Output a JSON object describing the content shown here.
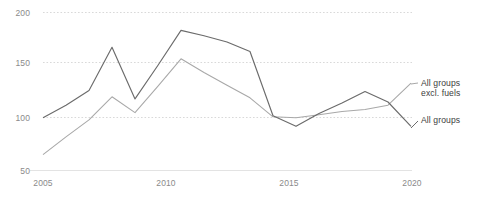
{
  "chart_data": {
    "type": "line",
    "title": "",
    "subtitle": "",
    "xlabel": "",
    "ylabel": "",
    "xlim": [
      2005,
      2021
    ],
    "ylim": [
      50,
      200
    ],
    "grid": true,
    "gridlines_y": [
      50,
      100,
      150,
      200
    ],
    "legend_position": "right-inline",
    "x": [
      2005,
      2006,
      2007,
      2008,
      2009,
      2010,
      2011,
      2012,
      2013,
      2014,
      2015,
      2016,
      2017,
      2018,
      2019,
      2020,
      2021
    ],
    "xticks": [
      2005,
      2010,
      2015,
      2020
    ],
    "xtick_labels": [
      "2005",
      "2010",
      "2015",
      "2020"
    ],
    "yticks": [
      50,
      100,
      150,
      200
    ],
    "ytick_labels": [
      "50",
      "100",
      "150",
      "200"
    ],
    "series": [
      {
        "name": "All groups",
        "color": "#6b6b6b",
        "values": [
          100,
          112,
          126,
          167,
          118,
          150,
          183,
          178,
          172,
          163,
          102,
          92,
          104,
          114,
          125,
          115,
          92
        ]
      },
      {
        "name": "All groups excl. fuels",
        "color": "#a8a8a8",
        "values": [
          65,
          82,
          98,
          120,
          105,
          130,
          156,
          143,
          131,
          119,
          101,
          100,
          103,
          106,
          108,
          112,
          133
        ]
      }
    ],
    "annotations": [
      {
        "text": "All groups\nexcl. fuels",
        "x": 2021,
        "y": 133
      },
      {
        "text": "All groups",
        "x": 2021,
        "y": 92
      }
    ]
  },
  "axis": {
    "y": {
      "labels": [
        "200",
        "150",
        "100",
        "50"
      ]
    },
    "x": {
      "labels": [
        "2005",
        "2010",
        "2015",
        "2020"
      ]
    }
  },
  "labels": {
    "series_excl_fuels": "All groups\nexcl. fuels",
    "series_all_groups": "All groups"
  }
}
